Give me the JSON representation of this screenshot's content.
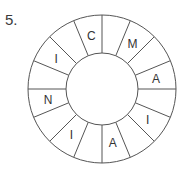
{
  "question_number": "5.",
  "wheel": {
    "center": [
      102,
      89
    ],
    "outer_radius": 74,
    "inner_radius": 36,
    "label_radius": 55,
    "segment_count": 16,
    "stroke_color": "#555555",
    "segments_clockwise_from_top": [
      "",
      "M",
      "",
      "A",
      "",
      "I",
      "",
      "A",
      "",
      "I",
      "",
      "N",
      "",
      "I",
      "",
      "C"
    ]
  }
}
